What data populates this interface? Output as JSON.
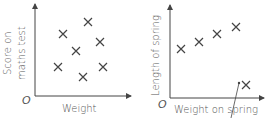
{
  "chart_data": [
    {
      "type": "scatter",
      "title": "",
      "xlabel": "Weight",
      "ylabel": "Score on maths test",
      "origin_label": "O",
      "grid": false,
      "points": [
        {
          "x": 88,
          "y": 22
        },
        {
          "x": 63,
          "y": 34
        },
        {
          "x": 100,
          "y": 42
        },
        {
          "x": 76,
          "y": 51
        },
        {
          "x": 58,
          "y": 67
        },
        {
          "x": 103,
          "y": 67
        },
        {
          "x": 83,
          "y": 77
        }
      ],
      "note": "No correlation; values are pixel positions (unlabelled axes)"
    },
    {
      "type": "scatter",
      "title": "",
      "xlabel": "Weight on spring",
      "ylabel": "Length of spring",
      "origin_label": "O",
      "grid": false,
      "points": [
        {
          "x": 181,
          "y": 49
        },
        {
          "x": 199,
          "y": 42
        },
        {
          "x": 217,
          "y": 34
        },
        {
          "x": 236,
          "y": 27
        },
        {
          "x": 246,
          "y": 85
        }
      ],
      "annotation": {
        "type": "pointer-line",
        "target_point_index": 4,
        "text": ""
      },
      "note": "Positive correlation with one outlier; values are pixel positions (unlabelled axes)"
    }
  ],
  "labels": {
    "left": {
      "ylabel_line1": "Score on",
      "ylabel_line2": "maths test",
      "xlabel": "Weight",
      "origin": "O"
    },
    "right": {
      "ylabel": "Length of spring",
      "xlabel": "Weight on spring",
      "origin": "O"
    }
  }
}
